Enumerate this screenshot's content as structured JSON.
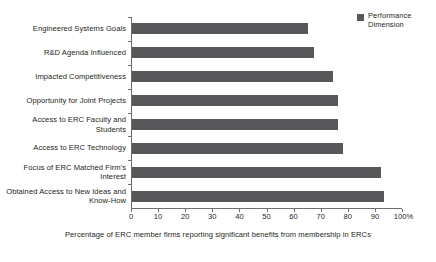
{
  "chart_data": {
    "type": "bar",
    "orientation": "horizontal",
    "title": "",
    "xlabel": "Percentage of ERC member firms reporting significant benefits from membership in ERCs",
    "ylabel": "",
    "xlim": [
      0,
      100
    ],
    "xticks": [
      "0",
      "10",
      "20",
      "30",
      "40",
      "50",
      "60",
      "70",
      "80",
      "90",
      "100%"
    ],
    "xtick_values": [
      0,
      10,
      20,
      30,
      40,
      50,
      60,
      70,
      80,
      90,
      100
    ],
    "grid": false,
    "legend_position": "top-right",
    "categories": [
      "Engineered Systems Goals",
      "R&D Agenda Influenced",
      "Impacted Competitiveness",
      "Opportunity for Joint Projects",
      "Access to ERC Faculty and Students",
      "Access to ERC Technology",
      "Focus of ERC Matched Firm's Interest",
      "Obtained Access to New Ideas and Know-How"
    ],
    "series": [
      {
        "name": "Performance Dimension",
        "color": "#58585a",
        "values": [
          65,
          67,
          74,
          76,
          76,
          78,
          92,
          93
        ]
      }
    ]
  },
  "legend": {
    "swatch_color": "#58585a",
    "label": "Performance Dimension"
  }
}
